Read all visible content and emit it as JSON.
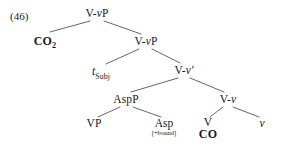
{
  "figure": {
    "example_number": "(46)",
    "background_color": "#ffffff",
    "line_color": "#555555",
    "text_color": "#1a1a1a",
    "width": 283,
    "height": 154
  },
  "tree": {
    "type": "syntax-tree",
    "nodes": [
      {
        "id": "n1",
        "label": "V-vP",
        "kind": "category",
        "x": 97,
        "y": 14,
        "italic_part": "v"
      },
      {
        "id": "n2",
        "label": "CO2",
        "kind": "lexical",
        "x": 45,
        "y": 40,
        "text": "CO",
        "subscript": "2"
      },
      {
        "id": "n3",
        "label": "V-vP",
        "kind": "category",
        "x": 146,
        "y": 42,
        "italic_part": "v"
      },
      {
        "id": "n4",
        "label": "tSubj",
        "kind": "trace",
        "x": 101,
        "y": 72,
        "text": "t",
        "subscript": "Subj"
      },
      {
        "id": "n5",
        "label": "V-v′",
        "kind": "category",
        "x": 184,
        "y": 71,
        "italic_part": "v"
      },
      {
        "id": "n6",
        "label": "AspP",
        "kind": "category",
        "x": 126,
        "y": 100
      },
      {
        "id": "n7",
        "label": "VP",
        "kind": "category",
        "x": 94,
        "y": 124
      },
      {
        "id": "n8",
        "label": "Asp",
        "kind": "category",
        "x": 164,
        "y": 124,
        "feature": "[+bound]"
      },
      {
        "id": "n9",
        "label": "V-v",
        "kind": "category",
        "x": 228,
        "y": 100,
        "italic_part": "v"
      },
      {
        "id": "n10",
        "label": "V",
        "kind": "category",
        "x": 208,
        "y": 124,
        "lexical": "CO"
      },
      {
        "id": "n11",
        "label": "v",
        "kind": "head-italic",
        "x": 262,
        "y": 124
      }
    ],
    "edges": [
      {
        "from": "n1",
        "to": "n2"
      },
      {
        "from": "n1",
        "to": "n3"
      },
      {
        "from": "n3",
        "to": "n4"
      },
      {
        "from": "n3",
        "to": "n5"
      },
      {
        "from": "n5",
        "to": "n6"
      },
      {
        "from": "n5",
        "to": "n9"
      },
      {
        "from": "n6",
        "to": "n7"
      },
      {
        "from": "n6",
        "to": "n8"
      },
      {
        "from": "n9",
        "to": "n10"
      },
      {
        "from": "n9",
        "to": "n11"
      }
    ],
    "labels": {
      "root": "V-vP",
      "spec_subject": "CO2",
      "intermediate_vp": "V-vP",
      "trace_subject_t": "t",
      "trace_subject_sub": "Subj",
      "vbar": "V-v′",
      "aspp": "AspP",
      "vp": "VP",
      "asp": "Asp",
      "asp_feature": "[+bound]",
      "v_little_v": "V-v",
      "verb_head": "V",
      "verb_lexical": "CO",
      "little_v": "v",
      "co2_base": "CO",
      "co2_sub": "2"
    }
  }
}
